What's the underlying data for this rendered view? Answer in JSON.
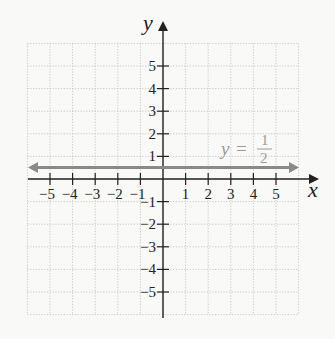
{
  "chart_data": {
    "type": "line",
    "title": "",
    "xlabel": "x",
    "ylabel": "y",
    "xlim": [
      -6,
      6
    ],
    "ylim": [
      -6,
      6
    ],
    "grid": true,
    "x_ticks": [
      "-5",
      "-4",
      "-3",
      "-2",
      "-1",
      "1",
      "2",
      "3",
      "4",
      "5"
    ],
    "y_ticks": [
      "5",
      "4",
      "3",
      "2",
      "1",
      "-1",
      "-2",
      "-3",
      "-4",
      "-5"
    ],
    "series": [
      {
        "name": "y = 1/2",
        "equation": "y = 1/2",
        "x": [
          -6,
          6
        ],
        "y": [
          0.5,
          0.5
        ],
        "color": "#8a8a8a",
        "arrows": "both"
      }
    ],
    "annotation": {
      "lhs": "y",
      "eq": "=",
      "num": "1",
      "den": "2"
    }
  },
  "axes": {
    "x_label": "x",
    "y_label": "y"
  },
  "colors": {
    "axis": "#222222",
    "line": "#8a8a8a",
    "grid": "#b8b8b8",
    "label": "#9a9a9a"
  }
}
